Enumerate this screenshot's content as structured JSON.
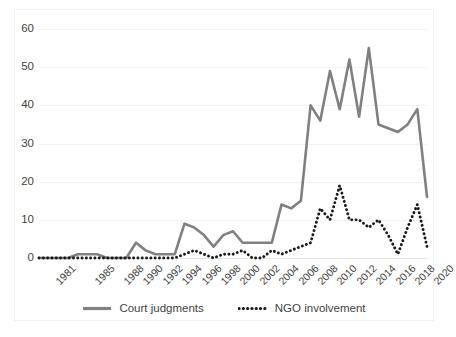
{
  "chart_data": {
    "type": "line",
    "title": "",
    "subtitle": "",
    "xlabel": "",
    "ylabel": "",
    "ylim": [
      0,
      60
    ],
    "yticks": [
      0,
      10,
      20,
      30,
      40,
      50,
      60
    ],
    "grid": true,
    "legend_position": "bottom",
    "x": [
      1981,
      1982,
      1983,
      1984,
      1985,
      1986,
      1987,
      1988,
      1989,
      1990,
      1991,
      1992,
      1993,
      1994,
      1995,
      1996,
      1997,
      1998,
      1999,
      2000,
      2001,
      2002,
      2003,
      2004,
      2005,
      2006,
      2007,
      2008,
      2009,
      2010,
      2011,
      2012,
      2013,
      2014,
      2015,
      2016,
      2017,
      2018,
      2019,
      2020,
      2021
    ],
    "xtick_labels": [
      "1981",
      "1985",
      "1988",
      "1990",
      "1992",
      "1994",
      "1996",
      "1998",
      "2000",
      "2002",
      "2004",
      "2006",
      "2008",
      "2010",
      "2012",
      "2014",
      "2016",
      "2018",
      "2020"
    ],
    "xtick_years": [
      1981,
      1985,
      1988,
      1990,
      1992,
      1994,
      1996,
      1998,
      2000,
      2002,
      2004,
      2006,
      2008,
      2010,
      2012,
      2014,
      2016,
      2018,
      2020
    ],
    "series": [
      {
        "name": "Court judgments",
        "color": "#808080",
        "style": "solid",
        "values": [
          0,
          0,
          0,
          0,
          1,
          1,
          1,
          0,
          0,
          0,
          4,
          2,
          1,
          1,
          1,
          9,
          8,
          6,
          3,
          6,
          7,
          4,
          4,
          4,
          4,
          14,
          13,
          15,
          40,
          36,
          49,
          39,
          52,
          37,
          55,
          35,
          34,
          33,
          35,
          39,
          16
        ]
      },
      {
        "name": "NGO involvement",
        "color": "#1a1a1a",
        "style": "dotted",
        "values": [
          0,
          0,
          0,
          0,
          0,
          0,
          0,
          0,
          0,
          0,
          0,
          0,
          0,
          0,
          0,
          1,
          2,
          1,
          0,
          1,
          1,
          2,
          0,
          0,
          2,
          1,
          2,
          3,
          4,
          13,
          10,
          19,
          10,
          10,
          8,
          10,
          6,
          1,
          8,
          14,
          3
        ]
      }
    ]
  },
  "legend": {
    "items": [
      {
        "label": "Court judgments",
        "key": "solid-line-key"
      },
      {
        "label": "NGO involvement",
        "key": "dotted-line-key"
      }
    ]
  },
  "colors": {
    "court_judgments": "#808080",
    "ngo_involvement": "#1a1a1a",
    "gridline": "#f2f2f2",
    "text": "#3f3f3f",
    "background": "#ffffff"
  }
}
